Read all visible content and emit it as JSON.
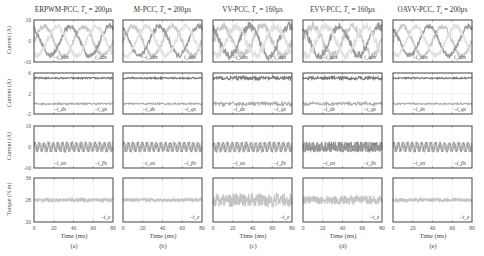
{
  "chart_data": {
    "type": "line",
    "layout": "4 rows x 5 columns grid of time-series subplots",
    "columns": [
      {
        "title": "ERPWM-PCC, T_s = 200µs",
        "label": "(a)"
      },
      {
        "title": "M-PCC, T_s = 200µs",
        "label": "(b)"
      },
      {
        "title": "VV-PCC, T_s = 160µs",
        "label": "(c)"
      },
      {
        "title": "EVV-PCC, T_s = 160µs",
        "label": "(d)"
      },
      {
        "title": "OAVV-PCC, T_s = 200µs",
        "label": "(e)"
      }
    ],
    "rows": [
      {
        "ylabel": "Current (A)",
        "yticks": [
          -10,
          0,
          10
        ],
        "ylim": [
          -10,
          10
        ],
        "legend": [
          "i_abs",
          "i_abs"
        ],
        "series": "three-phase sinusoidal currents, amplitude ~7 A, ~2 periods over 80 ms"
      },
      {
        "ylabel": "Current (A)",
        "yticks": [
          -2,
          2,
          6
        ],
        "ylim": [
          -2,
          6
        ],
        "legend": [
          "i_ds",
          "i_qs"
        ],
        "series": [
          {
            "name": "i_qs",
            "value": 5
          },
          {
            "name": "i_ds",
            "value": 0
          }
        ]
      },
      {
        "ylabel": "Current (A)",
        "yticks": [
          -10,
          0,
          10
        ],
        "ylim": [
          -10,
          10
        ],
        "legend": [
          "i_αs",
          "i_βs"
        ],
        "series": "harmonic currents oscillating about 0, amplitude ~2-3 A"
      },
      {
        "ylabel": "Torque (N.m)",
        "yticks": [
          20,
          28,
          36
        ],
        "ylim": [
          20,
          36
        ],
        "legend": [
          "t_e"
        ],
        "series": [
          {
            "name": "t_e",
            "value": 28
          }
        ]
      }
    ],
    "xlabel": "Time (ms)",
    "xticks": [
      0,
      20,
      40,
      60,
      80
    ],
    "xlim": [
      0,
      80
    ],
    "ripple": {
      "ERPWM-PCC": {
        "i_abs": 1.2,
        "i_dq": 0.15,
        "i_ab_harm": 2.5,
        "torque": 0.6
      },
      "M-PCC": {
        "i_abs": 1.2,
        "i_dq": 0.15,
        "i_ab_harm": 2.5,
        "torque": 0.6
      },
      "VV-PCC": {
        "i_abs": 2.0,
        "i_dq": 0.35,
        "i_ab_harm": 3.0,
        "torque": 2.5
      },
      "EVV-PCC": {
        "i_abs": 2.0,
        "i_dq": 0.3,
        "i_ab_harm": 3.0,
        "torque": 1.6
      },
      "OAVV-PCC": {
        "i_abs": 1.0,
        "i_dq": 0.15,
        "i_ab_harm": 2.5,
        "torque": 0.6
      }
    }
  },
  "labels": {
    "col0_title": "ERPWM-PCC, ",
    "col1_title": "M-PCC, ",
    "col2_title": "VV-PCC, ",
    "col3_title": "EVV-PCC, ",
    "col4_title": "OAVV-PCC, ",
    "ts_200": " = 200µs",
    "ts_160": " = 160µs",
    "ylabel_current": "Current (A)",
    "ylabel_torque": "Torque (N.m)",
    "xlabel": "Time (ms)",
    "sub_a": "(a)",
    "sub_b": "(b)",
    "sub_c": "(c)",
    "sub_d": "(d)",
    "sub_e": "(e)"
  }
}
